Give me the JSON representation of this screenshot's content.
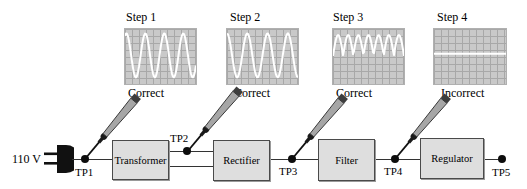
{
  "diagram": {
    "title_hint": "power-supply signal tracing",
    "source_label": "110 V",
    "steps": [
      {
        "label": "Step 1",
        "result": "Correct",
        "waveform": {
          "type": "sine",
          "cycles": 3.75,
          "phase": 0.35
        }
      },
      {
        "label": "Step 2",
        "result": "Correct",
        "waveform": {
          "type": "sine",
          "cycles": 3.5,
          "phase": 0.5
        }
      },
      {
        "label": "Step 3",
        "result": "Correct",
        "waveform": {
          "type": "rectified",
          "humps": 7
        }
      },
      {
        "label": "Step 4",
        "result": "Incorrect",
        "waveform": {
          "type": "flat",
          "level": 0.45
        }
      }
    ],
    "blocks": [
      {
        "label": "Transformer"
      },
      {
        "label": "Rectifier"
      },
      {
        "label": "Filter"
      },
      {
        "label": "Regulator"
      }
    ],
    "test_points": [
      {
        "label": "TP1"
      },
      {
        "label": "TP2"
      },
      {
        "label": "TP3"
      },
      {
        "label": "TP4"
      },
      {
        "label": "TP5"
      }
    ],
    "colors": {
      "screen_bg": "#c9c9c9",
      "screen_grid": "#a8a8a8",
      "trace": "#ffffff",
      "block_fill": "#dedede",
      "block_border": "#4a4a4a",
      "wire": "#333333",
      "dot": "#0d0d0d",
      "text": "#000000"
    }
  }
}
